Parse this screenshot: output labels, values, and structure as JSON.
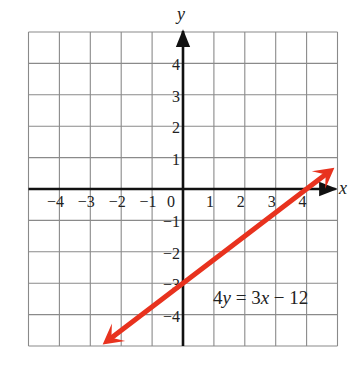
{
  "chart_data": {
    "type": "line",
    "title": "",
    "xlabel": "x",
    "ylabel": "y",
    "xlim": [
      -5,
      5
    ],
    "ylim": [
      -5,
      5
    ],
    "grid": true,
    "x_ticks": [
      -4,
      -3,
      -2,
      -1,
      0,
      1,
      2,
      3,
      4
    ],
    "y_ticks": [
      4,
      3,
      2,
      1,
      -1,
      -2,
      -3,
      -4
    ],
    "x_tick_labels": [
      "−4",
      "−3",
      "−2",
      "−1",
      "0",
      "1",
      "2",
      "3",
      "4"
    ],
    "y_tick_labels": [
      "4",
      "3",
      "2",
      "1",
      "−1",
      "−2",
      "−3",
      "−4"
    ],
    "series": [
      {
        "name": "4y = 3x − 12",
        "equation": "4y = 3x - 12",
        "slope": 0.75,
        "y_intercept": -3,
        "x_intercept": 4,
        "x": [
          -2.6,
          0,
          4,
          4.9
        ],
        "y": [
          -4.95,
          -3,
          0,
          0.675
        ],
        "color": "#e8321e",
        "arrows": "both"
      }
    ],
    "annotations": [
      {
        "text": "4y = 3x − 12",
        "x": 1.0,
        "y": -3.6
      }
    ]
  },
  "labels": {
    "x_axis": "x",
    "y_axis": "y",
    "eq_a": "4",
    "eq_var_y": "y",
    "eq_eq": " = ",
    "eq_b": "3",
    "eq_var_x": "x",
    "eq_rest": " − 12"
  },
  "colors": {
    "line": "#e8321e",
    "grid": "#8a8a8a",
    "axis": "#111111"
  }
}
